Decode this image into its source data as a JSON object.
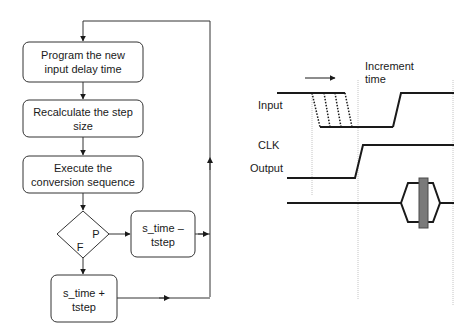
{
  "flowchart": {
    "steps": [
      {
        "line1": "Program the new",
        "line2": "input delay time"
      },
      {
        "line1": "Recalculate the step",
        "line2": "size"
      },
      {
        "line1": "Execute the",
        "line2": "conversion sequence"
      }
    ],
    "decision": {
      "pass_label": "P",
      "fail_label": "F"
    },
    "pass_box": {
      "line1": "s_time –",
      "line2": "tstep"
    },
    "fail_box": {
      "line1": "s_time +",
      "line2": "tstep"
    }
  },
  "timing": {
    "annotation": {
      "line1": "Increment",
      "line2": "time"
    },
    "signals": [
      "Input",
      "CLK",
      "Output"
    ]
  },
  "colors": {
    "line": "#1a1a1a",
    "guide": "#bdbdbd",
    "bar": "#7a7a7a"
  }
}
